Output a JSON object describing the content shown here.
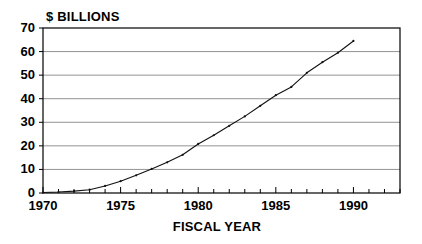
{
  "chart_data": {
    "type": "line",
    "title": "",
    "ylabel": "$ BILLIONS",
    "xlabel": "FISCAL YEAR",
    "xlim": [
      1970,
      1993
    ],
    "ylim": [
      0,
      70
    ],
    "grid": true,
    "legend": null,
    "xticks": [
      1970,
      1971,
      1972,
      1973,
      1974,
      1975,
      1976,
      1977,
      1978,
      1979,
      1980,
      1981,
      1982,
      1983,
      1984,
      1985,
      1986,
      1987,
      1988,
      1989,
      1990,
      1991,
      1992,
      1993
    ],
    "xtick_labels": [
      "1970",
      "1975",
      "1980",
      "1985",
      "1990"
    ],
    "xtick_label_values": [
      1970,
      1975,
      1980,
      1985,
      1990
    ],
    "yticks": [
      0,
      10,
      20,
      30,
      40,
      50,
      60,
      70
    ],
    "ytick_labels": [
      "0",
      "10",
      "20",
      "30",
      "40",
      "50",
      "60",
      "70"
    ],
    "x": [
      1970,
      1971,
      1972,
      1973,
      1974,
      1975,
      1976,
      1977,
      1978,
      1979,
      1980,
      1981,
      1982,
      1983,
      1984,
      1985,
      1986,
      1987,
      1988,
      1989,
      1990
    ],
    "values": [
      0.2,
      0.4,
      0.8,
      1.4,
      3.0,
      5.0,
      7.5,
      10.2,
      13.0,
      16.2,
      20.8,
      24.5,
      28.5,
      32.5,
      37.0,
      41.5,
      45.0,
      51.0,
      55.5,
      59.5,
      64.5
    ],
    "series": [
      {
        "name": "$ Billions",
        "values": [
          0.2,
          0.4,
          0.8,
          1.4,
          3.0,
          5.0,
          7.5,
          10.2,
          13.0,
          16.2,
          20.8,
          24.5,
          28.5,
          32.5,
          37.0,
          41.5,
          45.0,
          51.0,
          55.5,
          59.5,
          64.5
        ],
        "color": "#111111"
      }
    ]
  }
}
